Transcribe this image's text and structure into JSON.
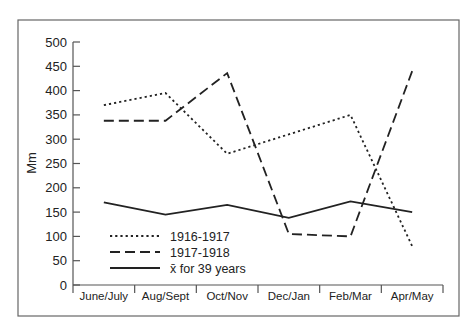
{
  "chart_data": {
    "type": "line",
    "title": "",
    "xlabel": "",
    "ylabel": "Mm",
    "ylim": [
      0,
      500
    ],
    "yticks": [
      0,
      50,
      100,
      150,
      200,
      250,
      300,
      350,
      400,
      450,
      500
    ],
    "grid": false,
    "legend_position": "lower-left inside",
    "categories": [
      "June/July",
      "Aug/Sept",
      "Oct/Nov",
      "Dec/Jan",
      "Feb/Mar",
      "Apr/May"
    ],
    "series": [
      {
        "name": "1916-1917",
        "style": "dotted",
        "values": [
          370,
          395,
          270,
          310,
          350,
          80
        ]
      },
      {
        "name": "1917-1918",
        "style": "dashed",
        "values": [
          338,
          338,
          436,
          105,
          100,
          440
        ]
      },
      {
        "name": "x̄ for 39 years",
        "style": "solid",
        "values": [
          170,
          145,
          165,
          138,
          172,
          150
        ]
      }
    ]
  },
  "colors": {
    "line": "#222222",
    "frame": "#555555",
    "axis": "#555555"
  }
}
